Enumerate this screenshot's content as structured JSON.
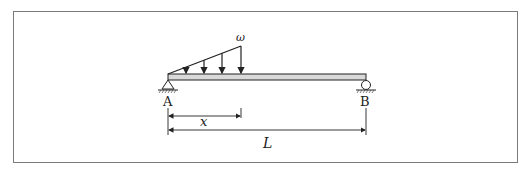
{
  "diagram": {
    "type": "simply-supported beam with triangular distributed load",
    "labels": {
      "support_left": "A",
      "support_right": "B",
      "load_intensity": "ω",
      "partial_length": "x",
      "total_length": "L"
    },
    "colors": {
      "frame": "#7a7a7a",
      "beam_fill": "#d9d9d9",
      "lines": "#222222"
    }
  }
}
